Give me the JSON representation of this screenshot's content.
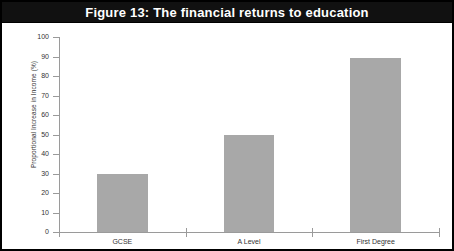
{
  "figure": {
    "title": "Figure 13: The financial returns to education",
    "border_color": "#000000",
    "title_band_color": "#111111",
    "title_text_color": "#ffffff"
  },
  "chart_data": {
    "type": "bar",
    "title": "Figure 13: The financial returns to education",
    "xlabel": "",
    "ylabel": "Proportional Increase in Income (%)",
    "categories": [
      "GCSE",
      "A Level",
      "First Degree"
    ],
    "values": [
      30,
      50,
      89
    ],
    "ylim": [
      0,
      100
    ],
    "ytick_step": 10,
    "yticks": [
      0,
      10,
      20,
      30,
      40,
      50,
      60,
      70,
      80,
      90,
      100
    ],
    "ytick_labels": [
      "0",
      "10",
      "20",
      "30",
      "40",
      "50",
      "60",
      "70",
      "80",
      "90",
      "100"
    ],
    "grid": false,
    "legend": null,
    "bar_color": "#a8a8a8",
    "axis_color": "#9a9a9a"
  }
}
